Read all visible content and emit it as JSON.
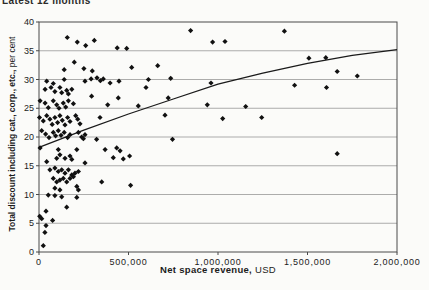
{
  "header": {
    "title": "Latest 12 months"
  },
  "axis_labels": {
    "x_bold": "Net space revenue,",
    "x_regular": " USD",
    "y_bold": "Total discount including cat., corp., etc.,",
    "y_regular": " per cent"
  },
  "chart_data": {
    "type": "scatter",
    "title": "Latest 12 months",
    "xlabel": "Net space revenue, USD",
    "ylabel": "Total discount including cat., corp., etc., per cent",
    "xlim": [
      0,
      2000000
    ],
    "ylim": [
      0,
      40
    ],
    "x_ticks": [
      0,
      500000,
      1000000,
      1500000,
      2000000
    ],
    "x_tick_labels": [
      "0",
      "500,000",
      "1,000,000",
      "1,500,000",
      "2,000,000"
    ],
    "y_ticks": [
      0,
      5,
      10,
      15,
      20,
      25,
      30,
      35,
      40
    ],
    "grid": "horizontal",
    "legend": "none",
    "marker": "diamond",
    "marker_color": "#111111",
    "grid_color": "#8a8a8a",
    "frame_color": "#4a4a4a",
    "trend_color": "#1a1a1a",
    "trend_line": [
      [
        0,
        18.2
      ],
      [
        250000,
        21.2
      ],
      [
        500000,
        24.0
      ],
      [
        750000,
        26.6
      ],
      [
        1000000,
        29.2
      ],
      [
        1250000,
        31.1
      ],
      [
        1500000,
        32.8
      ],
      [
        1750000,
        34.2
      ],
      [
        2000000,
        35.2
      ]
    ],
    "points": [
      [
        158000,
        37.3
      ],
      [
        214000,
        36.5
      ],
      [
        261000,
        35.9
      ],
      [
        309000,
        36.8
      ],
      [
        437000,
        35.5
      ],
      [
        490000,
        35.4
      ],
      [
        847000,
        38.5
      ],
      [
        970000,
        36.5
      ],
      [
        1039000,
        36.6
      ],
      [
        1371000,
        38.4
      ],
      [
        141000,
        31.7
      ],
      [
        197000,
        33.0
      ],
      [
        251000,
        31.9
      ],
      [
        298000,
        31.5
      ],
      [
        518000,
        32.1
      ],
      [
        663000,
        32.4
      ],
      [
        611000,
        30.0
      ],
      [
        736000,
        30.2
      ],
      [
        961000,
        29.4
      ],
      [
        1508000,
        33.7
      ],
      [
        1602000,
        33.8
      ],
      [
        1666000,
        31.4
      ],
      [
        1778000,
        30.6
      ],
      [
        43000,
        29.7
      ],
      [
        80000,
        29.3
      ],
      [
        141000,
        30.0
      ],
      [
        257000,
        29.7
      ],
      [
        291000,
        30.1
      ],
      [
        324000,
        30.3
      ],
      [
        343000,
        29.8
      ],
      [
        359000,
        30.1
      ],
      [
        397000,
        29.4
      ],
      [
        447000,
        29.7
      ],
      [
        1428000,
        29.0
      ],
      [
        1606000,
        28.6
      ],
      [
        598000,
        28.6
      ],
      [
        34000,
        28.3
      ],
      [
        67000,
        28.6
      ],
      [
        89000,
        27.9
      ],
      [
        117000,
        28.6
      ],
      [
        127000,
        27.7
      ],
      [
        155000,
        28.1
      ],
      [
        164000,
        27.5
      ],
      [
        183000,
        28.3
      ],
      [
        294000,
        27.1
      ],
      [
        443000,
        26.8
      ],
      [
        722000,
        26.8
      ],
      [
        1155000,
        25.3
      ],
      [
        555000,
        25.4
      ],
      [
        940000,
        25.6
      ],
      [
        6000,
        26.3
      ],
      [
        34000,
        25.9
      ],
      [
        80000,
        26.3
      ],
      [
        99000,
        25.6
      ],
      [
        136000,
        25.9
      ],
      [
        164000,
        26.3
      ],
      [
        192000,
        25.8
      ],
      [
        384000,
        25.6
      ],
      [
        52000,
        25.1
      ],
      [
        112000,
        25.0
      ],
      [
        149000,
        25.2
      ],
      [
        3000,
        23.4
      ],
      [
        24000,
        22.8
      ],
      [
        43000,
        23.7
      ],
      [
        61000,
        23.1
      ],
      [
        74000,
        22.2
      ],
      [
        89000,
        23.4
      ],
      [
        104000,
        22.5
      ],
      [
        117000,
        23.7
      ],
      [
        130000,
        22.9
      ],
      [
        145000,
        22.1
      ],
      [
        160000,
        23.4
      ],
      [
        173000,
        22.7
      ],
      [
        205000,
        23.7
      ],
      [
        216000,
        23.1
      ],
      [
        229000,
        22.3
      ],
      [
        341000,
        23.4
      ],
      [
        1026000,
        23.2
      ],
      [
        1244000,
        23.4
      ],
      [
        704000,
        23.8
      ],
      [
        15000,
        21.1
      ],
      [
        37000,
        20.5
      ],
      [
        56000,
        19.9
      ],
      [
        80000,
        20.8
      ],
      [
        93000,
        20.2
      ],
      [
        108000,
        21.1
      ],
      [
        123000,
        20.3
      ],
      [
        141000,
        20.8
      ],
      [
        160000,
        19.9
      ],
      [
        173000,
        20.4
      ],
      [
        220000,
        20.8
      ],
      [
        238000,
        20.0
      ],
      [
        257000,
        20.4
      ],
      [
        746000,
        19.6
      ],
      [
        248000,
        19.7
      ],
      [
        322000,
        19.6
      ],
      [
        6000,
        18.1
      ],
      [
        108000,
        17.8
      ],
      [
        211000,
        17.8
      ],
      [
        369000,
        17.8
      ],
      [
        434000,
        18.1
      ],
      [
        453000,
        17.6
      ],
      [
        43000,
        15.7
      ],
      [
        99000,
        16.3
      ],
      [
        117000,
        16.9
      ],
      [
        145000,
        16.3
      ],
      [
        173000,
        16.7
      ],
      [
        183000,
        16.1
      ],
      [
        257000,
        15.5
      ],
      [
        415000,
        16.4
      ],
      [
        471000,
        16.2
      ],
      [
        506000,
        16.7
      ],
      [
        1666000,
        17.1
      ],
      [
        61000,
        14.3
      ],
      [
        89000,
        14.6
      ],
      [
        108000,
        14.0
      ],
      [
        127000,
        14.3
      ],
      [
        145000,
        13.7
      ],
      [
        164000,
        14.3
      ],
      [
        183000,
        13.4
      ],
      [
        201000,
        13.7
      ],
      [
        220000,
        14.0
      ],
      [
        80000,
        12.8
      ],
      [
        99000,
        12.2
      ],
      [
        117000,
        12.5
      ],
      [
        136000,
        12.8
      ],
      [
        155000,
        12.2
      ],
      [
        173000,
        12.8
      ],
      [
        192000,
        13.1
      ],
      [
        89000,
        11.1
      ],
      [
        117000,
        10.8
      ],
      [
        211000,
        11.4
      ],
      [
        220000,
        10.8
      ],
      [
        350000,
        12.2
      ],
      [
        512000,
        11.6
      ],
      [
        52000,
        9.9
      ],
      [
        89000,
        9.8
      ],
      [
        127000,
        9.6
      ],
      [
        211000,
        9.5
      ],
      [
        155000,
        7.8
      ],
      [
        39000,
        7.1
      ],
      [
        76000,
        5.5
      ],
      [
        15000,
        5.8
      ],
      [
        4000,
        6.2
      ],
      [
        39000,
        4.6
      ],
      [
        33000,
        3.4
      ],
      [
        24000,
        1.1
      ]
    ]
  }
}
